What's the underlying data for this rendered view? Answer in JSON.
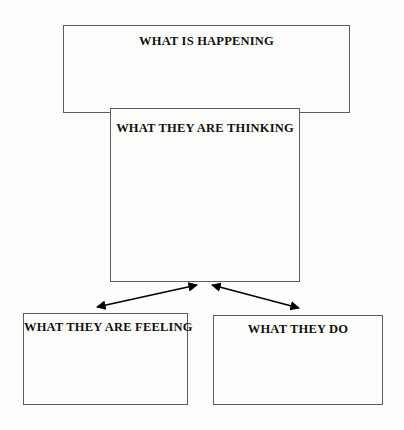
{
  "diagram": {
    "title_hint": "empathy-map-style flow diagram",
    "background_color": "#fdfdfc",
    "border_color": "#5d5d5d",
    "text_color": "#111111",
    "boxes": [
      {
        "id": "happening",
        "label": "WHAT IS HAPPENING"
      },
      {
        "id": "thinking",
        "label": "WHAT THEY ARE THINKING"
      },
      {
        "id": "feeling",
        "label": "WHAT THEY ARE FEELING"
      },
      {
        "id": "do",
        "label": "WHAT THEY DO"
      }
    ],
    "connectors": [
      {
        "id": "thinking-to-feeling",
        "style": "double-headed-arrow",
        "from": "thinking",
        "to": "feeling",
        "color": "#000000"
      },
      {
        "id": "thinking-to-do",
        "style": "double-headed-arrow",
        "from": "thinking",
        "to": "do",
        "color": "#000000"
      }
    ]
  }
}
